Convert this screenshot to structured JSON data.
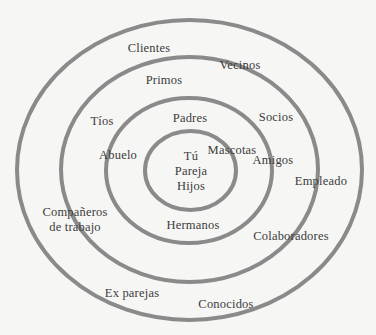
{
  "diagram": {
    "type": "concentric-circles",
    "ring_color": "#8a8a8a",
    "background": "#f6f6f4",
    "text_color": "#3c3c3c",
    "rings": [
      {
        "name": "outer",
        "cx": 189.5,
        "cy": 170,
        "rx": 172.5,
        "ry": 150
      },
      {
        "name": "second",
        "cx": 189.5,
        "cy": 169.5,
        "rx": 128.5,
        "ry": 112.5
      },
      {
        "name": "third",
        "cx": 189,
        "cy": 170.5,
        "rx": 83,
        "ry": 72.5
      },
      {
        "name": "inner",
        "cx": 190.5,
        "cy": 170.5,
        "rx": 45.5,
        "ry": 39.5
      }
    ],
    "labels": {
      "tu": "Tú",
      "pareja": "Pareja",
      "hijos": "Hijos",
      "padres": "Padres",
      "mascotas": "Mascotas",
      "abuelo": "Abuelo",
      "amigos": "Amigos",
      "hermanos": "Hermanos",
      "tios": "Tíos",
      "socios": "Socios",
      "primos": "Primos",
      "vecinos": "Vecinos",
      "clientes": "Clientes",
      "empleado": "Empleado",
      "companeros_1": "Compañeros",
      "companeros_2": "de trabajo",
      "colaboradores": "Colaboradores",
      "ex_parejas": "Ex parejas",
      "conocidos": "Conocidos"
    }
  }
}
